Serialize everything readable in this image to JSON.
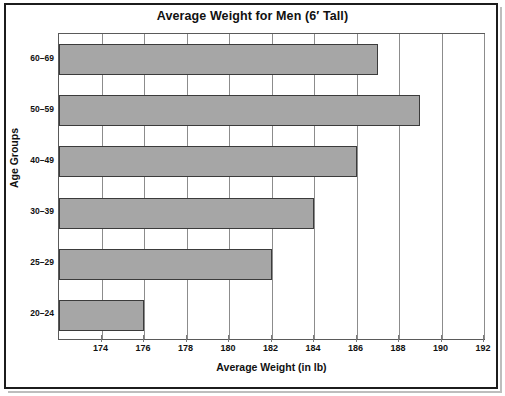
{
  "chart_data": {
    "type": "bar",
    "orientation": "horizontal",
    "title": "Average Weight for Men (6′ Tall)",
    "xlabel": "Average Weight (in lb)",
    "ylabel": "Age Groups",
    "categories": [
      "20–24",
      "25–29",
      "30–39",
      "40–49",
      "50–59",
      "60–69"
    ],
    "values": [
      176,
      182,
      184,
      186,
      189,
      187
    ],
    "xlim": [
      172,
      192
    ],
    "xticks": [
      174,
      176,
      178,
      180,
      182,
      184,
      186,
      188,
      190,
      192
    ],
    "xtick_labels": [
      "174",
      "176",
      "178",
      "180",
      "182",
      "184",
      "186",
      "188",
      "190",
      "192"
    ],
    "grid": "vertical",
    "legend": "none",
    "bar_color": "#a6a6a6",
    "bar_edge_color": "#3b3b3b",
    "gridline_color": "#8c8c8c",
    "frame_color": "#1c1c1c"
  }
}
